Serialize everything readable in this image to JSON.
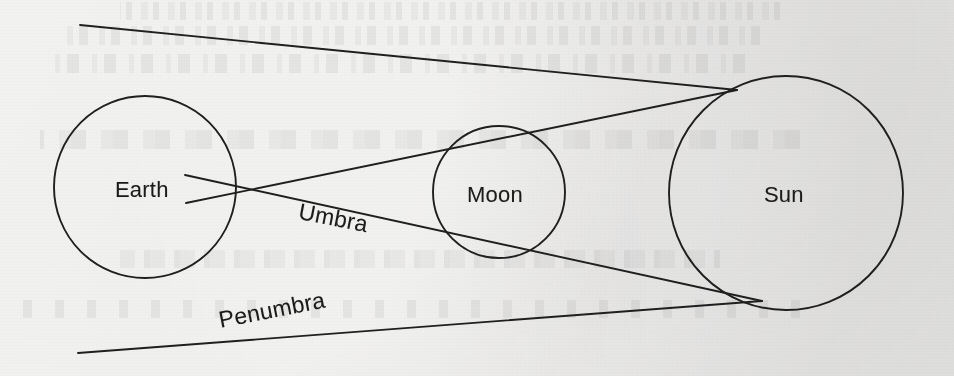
{
  "figure": {
    "kind": "solar-eclipse-geometry-diagram",
    "medium": "scanned notebook page",
    "background_color": "#f3f3f2",
    "ink_color": "#1b1b1b",
    "width": 954,
    "height": 376
  },
  "bodies": [
    {
      "id": "earth",
      "label": "Earth",
      "cx": 145,
      "cy": 187,
      "r": 91,
      "label_x": 115,
      "label_y": 177
    },
    {
      "id": "moon",
      "label": "Moon",
      "cx": 499,
      "cy": 192,
      "r": 66,
      "label_x": 467,
      "label_y": 182
    },
    {
      "id": "sun",
      "label": "Sun",
      "cx": 786,
      "cy": 193,
      "r": 117,
      "label_x": 764,
      "label_y": 182
    }
  ],
  "ray_labels": [
    {
      "id": "umbra",
      "label": "Umbra",
      "x": 299,
      "y": 198,
      "rotate_deg": 11
    },
    {
      "id": "penumbra",
      "label": "Penumbra",
      "x": 219,
      "y": 307,
      "rotate_deg": -11
    }
  ],
  "rays": [
    {
      "id": "umbra-upper",
      "role": "umbra",
      "description": "from Earth upper surface through Moon lower crossing to Sun lower tangent",
      "x1": 185,
      "y1": 175,
      "x2": 762,
      "y2": 301
    },
    {
      "id": "umbra-lower",
      "role": "umbra",
      "description": "from Earth lower surface through Moon upper crossing to Sun upper tangent",
      "x1": 186,
      "y1": 203,
      "x2": 737,
      "y2": 90
    },
    {
      "id": "penumbra-upper",
      "role": "penumbra",
      "description": "from upper left outward through Moon upper crossing to Sun upper tangent",
      "x1": 80,
      "y1": 25,
      "x2": 737,
      "y2": 90
    },
    {
      "id": "penumbra-lower",
      "role": "penumbra",
      "description": "from lower left outward through Moon lower crossing to Sun lower tangent",
      "x1": 78,
      "y1": 353,
      "x2": 762,
      "y2": 301
    }
  ],
  "crossings": [
    {
      "id": "upper-crossing",
      "x": 500,
      "y": 127,
      "note": "top of Moon"
    },
    {
      "id": "lower-crossing",
      "x": 500,
      "y": 258,
      "note": "bottom of Moon"
    }
  ],
  "bleed_through": [
    {
      "text": "wavy faint script line",
      "x": 120,
      "y": 2,
      "size": 16,
      "width": 660
    },
    {
      "text": "faint reversed handwriting",
      "x": 60,
      "y": 26,
      "size": 17,
      "width": 700
    },
    {
      "text": "faint reversed handwriting row",
      "x": 55,
      "y": 54,
      "size": 17,
      "width": 690
    },
    {
      "text": "faint table header row",
      "x": 40,
      "y": 130,
      "size": 17,
      "width": 760
    },
    {
      "text": "faint numeric row",
      "x": 120,
      "y": 250,
      "size": 16,
      "width": 600
    },
    {
      "text": "faint numeric answer row",
      "x": 20,
      "y": 300,
      "size": 16,
      "width": 780
    }
  ]
}
